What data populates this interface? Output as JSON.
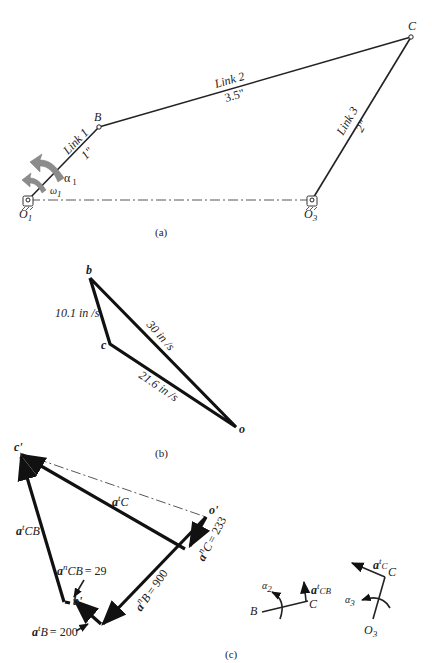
{
  "figure_a": {
    "caption": "(a)",
    "points": {
      "O1": "O",
      "O1_sub": "1",
      "B": "B",
      "C": "C",
      "O3": "O",
      "O3_sub": "3"
    },
    "link1": {
      "name": "Link 1",
      "length": "1\""
    },
    "link2": {
      "name": "Link 2",
      "length": "3.5\""
    },
    "link3": {
      "name": "Link 3",
      "length": "2\""
    },
    "alpha1": {
      "sym": "α",
      "sub": "1"
    },
    "omega1": {
      "sym": "ω",
      "sub": "1"
    }
  },
  "figure_b": {
    "caption": "(b)",
    "points": {
      "b": "b",
      "c": "c",
      "o": "o"
    },
    "vcb": "10.1 in /s",
    "vb": "30 in /s",
    "vc": "21.6 in /s"
  },
  "figure_c": {
    "caption": "(c)",
    "points": {
      "c_prime": "c'",
      "o_prime": "o'",
      "b_prime": "b'"
    },
    "atC": {
      "a": "a",
      "sup": "t",
      "sub": "C"
    },
    "atCB": {
      "a": "a",
      "sup": "t",
      "sub": "CB"
    },
    "anCB": {
      "a": "a",
      "sup": "n",
      "sub": "CB",
      "value": "= 29"
    },
    "anC": {
      "a": "a",
      "sup": "n",
      "sub": "C",
      "value": "= 233"
    },
    "anB": {
      "a": "a",
      "sup": "n",
      "sub": "B",
      "value": "= 900"
    },
    "atB": {
      "a": "a",
      "sup": "t",
      "sub": "B",
      "value": "= 200"
    },
    "inset_link2": {
      "B": "B",
      "C": "C",
      "alpha": "α",
      "alpha_sub": "2",
      "a": "a",
      "sup": "t",
      "sub": "CB"
    },
    "inset_link3": {
      "C": "C",
      "O": "O",
      "O_sub": "3",
      "alpha": "α",
      "alpha_sub": "3",
      "a": "a",
      "sup": "t",
      "sub": "C"
    }
  }
}
